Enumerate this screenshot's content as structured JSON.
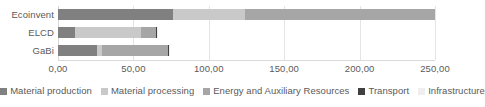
{
  "chart_data": {
    "type": "bar",
    "orientation": "horizontal",
    "stacked": true,
    "title": "",
    "xlabel": "",
    "ylabel": "",
    "xlim": [
      0,
      250
    ],
    "grid": true,
    "legend_position": "bottom",
    "categories": [
      "Ecoinvent",
      "ELCD",
      "GaBi"
    ],
    "xticks": [
      0,
      50,
      100,
      150,
      200,
      250
    ],
    "xtick_labels": [
      "0,00",
      "50,00",
      "100,00",
      "150,00",
      "200,00",
      "250,00"
    ],
    "series": [
      {
        "name": "Material production",
        "color": "#808080",
        "values": [
          76.0,
          11.0,
          26.0
        ]
      },
      {
        "name": "Material processing",
        "color": "#c9c9c9",
        "values": [
          48.0,
          44.0,
          3.0
        ]
      },
      {
        "name": "Energy and Auxiliary Resources",
        "color": "#a6a6a6",
        "values": [
          126.0,
          10.0,
          44.0
        ]
      },
      {
        "name": "Transport",
        "color": "#404040",
        "values": [
          0.0,
          0.5,
          0.5
        ]
      },
      {
        "name": "Infrastructure",
        "color": "#efefef",
        "values": [
          0.0,
          0.5,
          0.5
        ]
      }
    ],
    "totals": [
      250.0,
      66.0,
      74.0
    ]
  },
  "axis": {
    "tick_0": "0,00",
    "tick_1": "50,00",
    "tick_2": "100,00",
    "tick_3": "150,00",
    "tick_4": "200,00",
    "tick_5": "250,00"
  },
  "categories": {
    "ecoinvent": "Ecoinvent",
    "elcd": "ELCD",
    "gabi": "GaBi"
  },
  "legend": {
    "items": [
      {
        "label": "Material production",
        "color": "#808080"
      },
      {
        "label": "Material processing",
        "color": "#c9c9c9"
      },
      {
        "label": "Energy and Auxiliary Resources",
        "color": "#a6a6a6"
      },
      {
        "label": "Transport",
        "color": "#404040"
      },
      {
        "label": "Infrastructure",
        "color": "#efefef"
      }
    ]
  }
}
